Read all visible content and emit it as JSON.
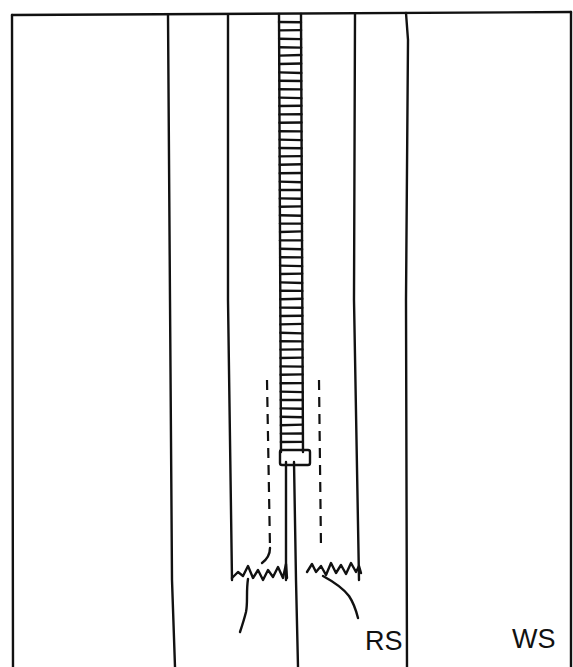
{
  "diagram": {
    "title": "",
    "labels": {
      "rs": "RS",
      "ws": "WS"
    },
    "colors": {
      "line": "#111111",
      "background": "#ffffff"
    },
    "parts": [
      "fabric-panel-left",
      "seam-line-left",
      "zipper-tape-left",
      "zipper-teeth",
      "zipper-slider",
      "zipper-tape-right",
      "seam-line-right",
      "fabric-panel-right",
      "stitching-dashed-left",
      "stitching-dashed-right",
      "frayed-edge-left",
      "frayed-edge-right",
      "thread-tail-left",
      "thread-tail-right"
    ]
  }
}
